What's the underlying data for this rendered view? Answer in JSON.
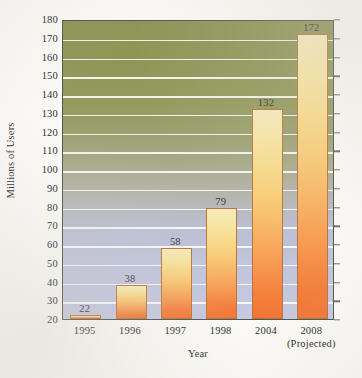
{
  "chart_data": {
    "type": "bar",
    "title": "",
    "xlabel": "Year",
    "ylabel": "Millions of Users",
    "categories": [
      "1995",
      "1996",
      "1997",
      "1998",
      "2004",
      "2008"
    ],
    "category_sublabels": [
      "",
      "",
      "",
      "",
      "",
      "(Projected)"
    ],
    "values": [
      22,
      38,
      58,
      79,
      132,
      172
    ],
    "data_labels": [
      "22",
      "38",
      "58",
      "79",
      "132",
      "172"
    ],
    "ylim": [
      20,
      180
    ],
    "ytick_labels": [
      "180",
      "170",
      "160",
      "150",
      "140",
      "130",
      "120",
      "110",
      "100",
      "90",
      "80",
      "70",
      "60",
      "50",
      "40",
      "30",
      "20"
    ],
    "ytick_values": [
      180,
      170,
      160,
      150,
      140,
      130,
      120,
      110,
      100,
      90,
      80,
      70,
      60,
      50,
      40,
      30,
      20
    ],
    "grid": true,
    "legend": "none",
    "colors": {
      "bar_top": "#f6ebbe",
      "bar_bottom": "#f27434",
      "bar_border": "#b9763b",
      "plot_bg_top": "#8c9455",
      "plot_bg_bottom": "#c5c9e1",
      "gridline": "#ffffff",
      "frame_border": "#4f5548",
      "text": "#2b2b2b",
      "page_bg": "#fbfaf7"
    }
  }
}
